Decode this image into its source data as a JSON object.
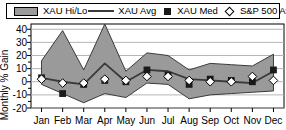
{
  "legend": {
    "items": [
      {
        "label": "XAU Hi/Lo",
        "marker": "band-swatch-icon",
        "color": "#9a9a9a"
      },
      {
        "label": "XAU Avg",
        "marker": "line-swatch-icon",
        "color": "#3a3a3a"
      },
      {
        "label": "XAU Med",
        "marker": "filled-square-icon",
        "color": "#1a1a1a"
      },
      {
        "label": "S&P 500 Avg",
        "marker": "open-diamond-icon",
        "color": "#ffffff"
      }
    ]
  },
  "axes": {
    "ylabel": "Monthly % Gain",
    "yticks": [
      "40",
      "30",
      "20",
      "10",
      "0",
      "-10",
      "-20"
    ],
    "ytick_values": [
      40,
      30,
      20,
      10,
      0,
      -10,
      -20
    ],
    "ylim": [
      -20,
      44
    ],
    "xticks": [
      "Jan",
      "Feb",
      "Mar",
      "Apr",
      "May",
      "Jun",
      "Jul",
      "Aug",
      "Sep",
      "Oct",
      "Nov",
      "Dec"
    ]
  },
  "chart_data": {
    "type": "line",
    "title": "",
    "xlabel": "",
    "ylabel": "Monthly % Gain",
    "categories": [
      "Jan",
      "Feb",
      "Mar",
      "Apr",
      "May",
      "Jun",
      "Jul",
      "Aug",
      "Sep",
      "Oct",
      "Nov",
      "Dec"
    ],
    "ylim": [
      -20,
      44
    ],
    "yticks": [
      40,
      30,
      20,
      10,
      0,
      -10,
      -20
    ],
    "grid": true,
    "legend_position": "top",
    "series": [
      {
        "name": "XAU Hi/Lo",
        "type": "band",
        "color": "#9a9a9a",
        "high": [
          16,
          39,
          9,
          44,
          8,
          22,
          20,
          9,
          14,
          13,
          12,
          21
        ],
        "low": [
          -2,
          -9,
          -16,
          -9,
          -12,
          -1,
          -2,
          -13,
          -10,
          -9,
          -8,
          -7
        ]
      },
      {
        "name": "XAU Avg",
        "type": "line",
        "color": "#3a3a3a",
        "values": [
          3,
          0,
          -2,
          14,
          0,
          9,
          8,
          2,
          1,
          0,
          -1,
          8
        ]
      },
      {
        "name": "XAU Med",
        "type": "marker",
        "marker": "filled-square",
        "color": "#1a1a1a",
        "values": [
          3,
          -9,
          -2,
          1,
          0,
          9,
          5,
          -2,
          2,
          1,
          0,
          9
        ]
      },
      {
        "name": "S&P 500 Avg",
        "type": "marker",
        "marker": "open-diamond",
        "color": "#ffffff",
        "values": [
          2,
          -1,
          -1,
          2,
          1,
          4,
          4,
          1,
          0,
          0,
          4,
          1
        ]
      }
    ]
  }
}
